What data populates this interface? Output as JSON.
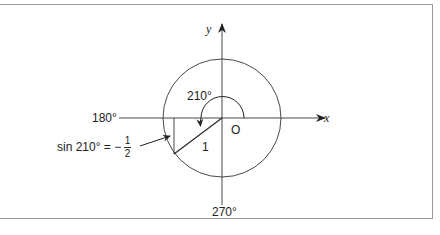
{
  "figure": {
    "axis_labels": {
      "x": "x",
      "y": "y"
    },
    "origin_label": "O",
    "angle_labels": {
      "left": "180°",
      "bottom": "270°",
      "rotation": "210°"
    },
    "hypotenuse_label": "1",
    "annotation": {
      "prefix": "sin 210° = −",
      "fraction_numerator": "1",
      "fraction_denominator": "2"
    },
    "colors": {
      "line": "#222222",
      "border": "#9a9a9a",
      "background": "#ffffff"
    }
  }
}
